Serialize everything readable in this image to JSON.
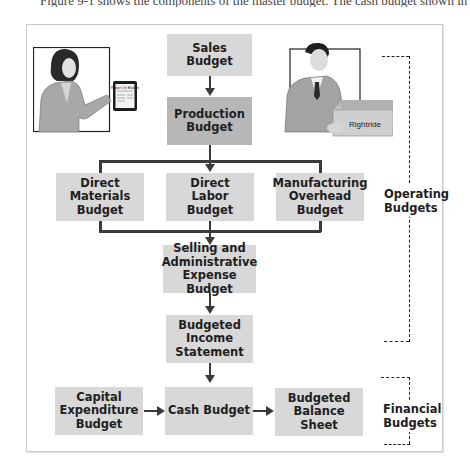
{
  "caption": {
    "text": "Figure 9-1 shows the components of the master budget. The cash budget shown in Illustration 20"
  },
  "diagram": {
    "boxes": {
      "sales": "Sales Budget",
      "production": "Production Budget",
      "direct_materials": "Direct Materials Budget",
      "direct_labor": "Direct Labor Budget",
      "manufacturing_overhead": "Manufacturing Overhead Budget",
      "selling_admin": "Selling and Administrative Expense Budget",
      "income_statement": "Budgeted Income Statement",
      "capital_expenditure": "Capital Expenditure Budget",
      "cash": "Cash Budget",
      "balance_sheet": "Budgeted Balance Sheet"
    },
    "groups": {
      "operating": "Operating Budgets",
      "financial": "Financial Budgets"
    },
    "illustrations": {
      "woman_tablet_text": "Report On Budget",
      "box_label": "Rightride"
    },
    "colors": {
      "box_fill": "#d8d8d8",
      "box_fill_dark": "#b7b7b7",
      "connector": "#3a3a3a"
    }
  }
}
